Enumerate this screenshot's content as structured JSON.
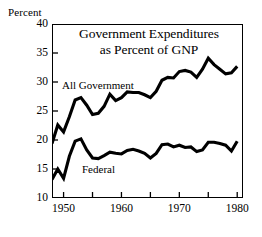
{
  "figure": {
    "y_axis_caption": "Percent",
    "title_line_1": "Government Expenditures",
    "title_line_2": "as Percent of GNP"
  },
  "labels": {
    "all_government": "All Government",
    "federal": "Federal"
  },
  "axes": {
    "y_ticks": [
      "40",
      "35",
      "30",
      "25",
      "20",
      "15",
      "10"
    ],
    "x_ticks": [
      "1950",
      "1960",
      "1970",
      "1980"
    ]
  },
  "chart_data": {
    "type": "line",
    "title": "Government Expenditures as Percent of GNP",
    "xlabel": "",
    "ylabel": "Percent",
    "xlim": [
      1948,
      1981
    ],
    "ylim": [
      10,
      40
    ],
    "y_ticks": [
      10,
      15,
      20,
      25,
      30,
      35,
      40
    ],
    "x_ticks": [
      1950,
      1960,
      1970,
      1980
    ],
    "x_minor_ticks": [
      1955,
      1965,
      1975
    ],
    "grid": false,
    "legend_position": "inline-annotation",
    "line_color": "#000000",
    "x": [
      1948,
      1949,
      1950,
      1951,
      1952,
      1953,
      1954,
      1955,
      1956,
      1957,
      1958,
      1959,
      1960,
      1961,
      1962,
      1963,
      1964,
      1965,
      1966,
      1967,
      1968,
      1969,
      1970,
      1971,
      1972,
      1973,
      1974,
      1975,
      1976,
      1977,
      1978,
      1979,
      1980
    ],
    "series": [
      {
        "name": "All Government",
        "values": [
          19.4,
          22.6,
          21.4,
          24.0,
          26.9,
          27.3,
          26.0,
          24.4,
          24.6,
          25.8,
          27.9,
          26.8,
          27.3,
          28.3,
          28.2,
          28.2,
          27.8,
          27.3,
          28.4,
          30.3,
          30.8,
          30.7,
          31.8,
          32.0,
          31.7,
          30.8,
          32.2,
          34.1,
          33.0,
          32.2,
          31.4,
          31.6,
          32.7
        ]
      },
      {
        "name": "Federal",
        "values": [
          13.2,
          15.0,
          13.4,
          17.2,
          19.8,
          20.2,
          18.3,
          16.9,
          16.8,
          17.3,
          17.9,
          17.7,
          17.6,
          18.2,
          18.4,
          18.1,
          17.7,
          16.9,
          17.7,
          19.2,
          19.3,
          18.8,
          19.1,
          18.7,
          18.8,
          18.0,
          18.3,
          19.6,
          19.6,
          19.4,
          19.1,
          18.1,
          19.8
        ]
      }
    ]
  }
}
